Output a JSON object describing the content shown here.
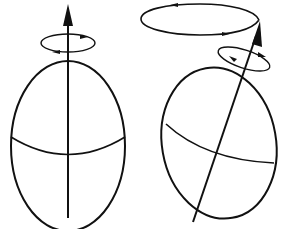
{
  "diagram": {
    "colors": {
      "stroke": "#111111",
      "background": "#ffffff"
    },
    "figures": [
      {
        "id": "upright-body",
        "elements": [
          "ellipsoid-outline",
          "equator-curve",
          "spin-axis-arrow",
          "spin-rotation-ring"
        ]
      },
      {
        "id": "tilted-body",
        "elements": [
          "ellipsoid-outline",
          "equator-curve",
          "spin-axis-arrow",
          "spin-rotation-ring",
          "precession-ellipse"
        ]
      }
    ]
  }
}
